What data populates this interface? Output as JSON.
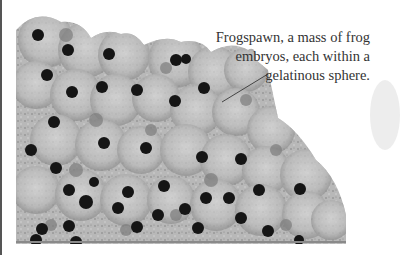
{
  "figure": {
    "caption_lines": [
      "Frogspawn, a mass of frog",
      "embryos, each within a",
      "gelatinous sphere."
    ]
  },
  "colors": {
    "background": "#ffffff",
    "jelly": "#bdbdbd",
    "embryo": "#151515",
    "caption_text": "#333333"
  }
}
